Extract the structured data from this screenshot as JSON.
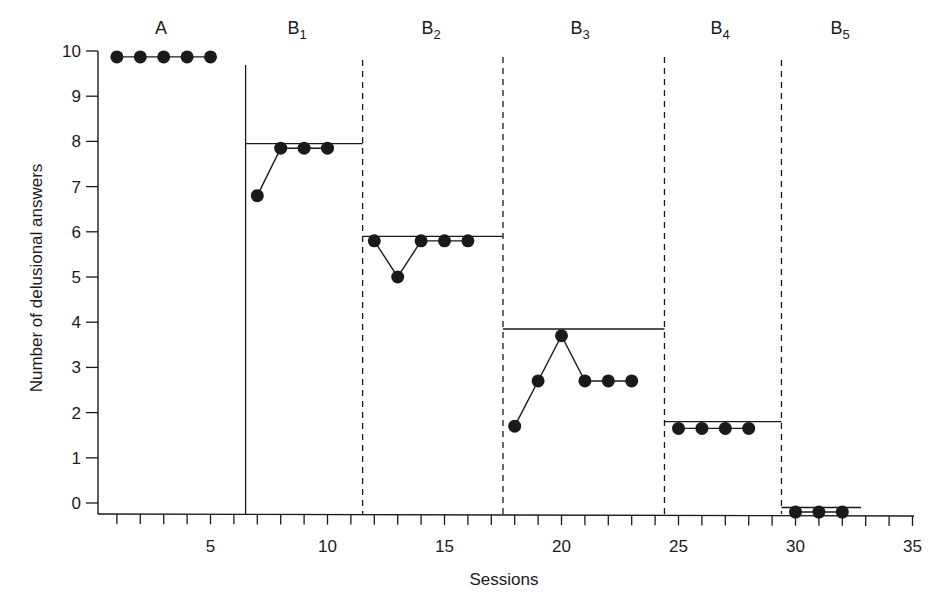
{
  "chart_data": {
    "type": "line",
    "title": "",
    "xlabel": "Sessions",
    "ylabel": "Number of delusional answers",
    "xlim": [
      0,
      35
    ],
    "ylim": [
      -0.3,
      10
    ],
    "x_ticks": [
      5,
      10,
      15,
      20,
      25,
      30,
      35
    ],
    "y_ticks": [
      0,
      1,
      2,
      3,
      4,
      5,
      6,
      7,
      8,
      9,
      10
    ],
    "grid": false,
    "legend": null,
    "phases": [
      {
        "label": "A",
        "sub": "",
        "start": 0.5,
        "end": 6.5,
        "criterion": null,
        "x": [
          1,
          2,
          3,
          4,
          5
        ],
        "y": [
          9.87,
          9.87,
          9.87,
          9.87,
          9.87
        ]
      },
      {
        "label": "B",
        "sub": "1",
        "start": 6.5,
        "end": 11.5,
        "criterion": 7.95,
        "x": [
          7,
          8,
          9,
          10
        ],
        "y": [
          6.8,
          7.85,
          7.85,
          7.85
        ]
      },
      {
        "label": "B",
        "sub": "2",
        "start": 11.5,
        "end": 17.5,
        "criterion": 5.9,
        "x": [
          12,
          13,
          14,
          15,
          16
        ],
        "y": [
          5.8,
          5.0,
          5.8,
          5.8,
          5.8
        ]
      },
      {
        "label": "B",
        "sub": "3",
        "start": 17.5,
        "end": 24.4,
        "criterion": 3.85,
        "x": [
          18,
          19,
          20,
          21,
          22,
          23
        ],
        "y": [
          1.7,
          2.7,
          3.7,
          2.7,
          2.7,
          2.7
        ]
      },
      {
        "label": "B",
        "sub": "4",
        "start": 24.4,
        "end": 29.4,
        "criterion": 1.8,
        "x": [
          25,
          26,
          27,
          28
        ],
        "y": [
          1.65,
          1.65,
          1.65,
          1.65
        ]
      },
      {
        "label": "B",
        "sub": "5",
        "start": 29.4,
        "end": 32.8,
        "criterion": -0.1,
        "x": [
          30,
          31,
          32
        ],
        "y": [
          -0.2,
          -0.2,
          -0.2
        ]
      }
    ],
    "phase_lines": [
      {
        "x": 6.5,
        "style": "solid"
      },
      {
        "x": 11.5,
        "style": "dashed"
      },
      {
        "x": 17.5,
        "style": "dashed"
      },
      {
        "x": 24.4,
        "style": "dashed"
      },
      {
        "x": 29.4,
        "style": "dashed"
      }
    ]
  },
  "colors": {
    "ink": "#1a1a1a",
    "background": "#ffffff"
  }
}
